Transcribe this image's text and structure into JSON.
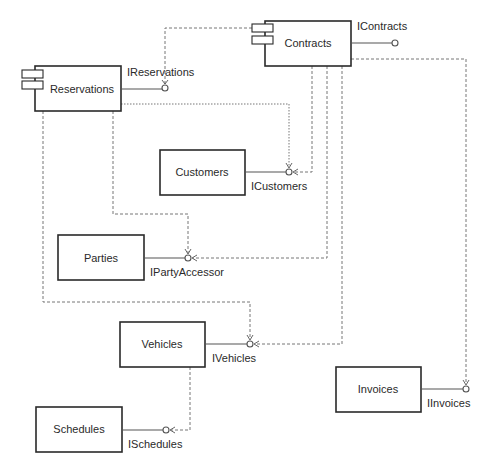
{
  "diagram": {
    "type": "UML component diagram",
    "components": [
      {
        "id": "contracts",
        "label": "Contracts",
        "stereotype_icon": true
      },
      {
        "id": "reservations",
        "label": "Reservations",
        "stereotype_icon": true
      },
      {
        "id": "customers",
        "label": "Customers"
      },
      {
        "id": "parties",
        "label": "Parties"
      },
      {
        "id": "vehicles",
        "label": "Vehicles"
      },
      {
        "id": "schedules",
        "label": "Schedules"
      },
      {
        "id": "invoices",
        "label": "Invoices"
      }
    ],
    "interfaces": [
      {
        "id": "icontracts",
        "label": "IContracts",
        "provided_by": "contracts"
      },
      {
        "id": "ireservations",
        "label": "IReservations",
        "provided_by": "reservations"
      },
      {
        "id": "icustomers",
        "label": "ICustomers",
        "provided_by": "customers"
      },
      {
        "id": "ipartyaccessor",
        "label": "IPartyAccessor",
        "provided_by": "parties"
      },
      {
        "id": "ivehicles",
        "label": "IVehicles",
        "provided_by": "vehicles"
      },
      {
        "id": "ischedules",
        "label": "ISchedules",
        "provided_by": "schedules"
      },
      {
        "id": "iinvoices",
        "label": "IInvoices",
        "provided_by": "invoices"
      }
    ],
    "dependencies": [
      {
        "from": "contracts",
        "to": "ireservations"
      },
      {
        "from": "contracts",
        "to": "icustomers"
      },
      {
        "from": "contracts",
        "to": "ipartyaccessor"
      },
      {
        "from": "contracts",
        "to": "ivehicles"
      },
      {
        "from": "contracts",
        "to": "iinvoices"
      },
      {
        "from": "reservations",
        "to": "icustomers"
      },
      {
        "from": "reservations",
        "to": "ipartyaccessor"
      },
      {
        "from": "reservations",
        "to": "ivehicles"
      },
      {
        "from": "vehicles",
        "to": "ischedules"
      }
    ]
  }
}
